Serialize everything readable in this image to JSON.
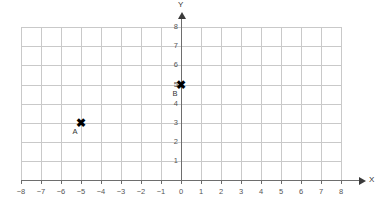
{
  "chart_data": {
    "type": "scatter",
    "title": "",
    "xlabel": "X",
    "ylabel": "Y",
    "xlim": [
      -8,
      8
    ],
    "ylim": [
      0,
      8
    ],
    "grid": true,
    "legend": null,
    "x_ticks": [
      "−8",
      "−7",
      "−6",
      "−5",
      "−4",
      "−3",
      "−2",
      "−1",
      "0",
      "1",
      "2",
      "3",
      "4",
      "5",
      "6",
      "7",
      "8"
    ],
    "x_tick_values": [
      -8,
      -7,
      -6,
      -5,
      -4,
      -3,
      -2,
      -1,
      0,
      1,
      2,
      3,
      4,
      5,
      6,
      7,
      8
    ],
    "y_ticks": [
      "1",
      "2",
      "3",
      "4",
      "5",
      "6",
      "7",
      "8"
    ],
    "y_tick_values": [
      1,
      2,
      3,
      4,
      5,
      6,
      7,
      8
    ],
    "points": [
      {
        "label": "A",
        "x": -5,
        "y": 3,
        "marker": "x-marker"
      },
      {
        "label": "B",
        "x": 0,
        "y": 5,
        "marker": "x-marker"
      }
    ],
    "colors": {
      "grid": "#c9c9c9",
      "axis": "#6e6e6e",
      "marker": "#000000",
      "text": "#555555",
      "background": "#ffffff"
    }
  },
  "axes": {
    "x_name": "X",
    "y_name": "Y"
  }
}
